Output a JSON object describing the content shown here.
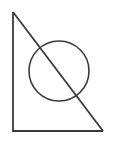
{
  "figure": {
    "background_color": "#ffffff",
    "stroke_color": "#3a3a3a",
    "canvas": {
      "width": 115,
      "height": 142
    },
    "shapes": {
      "triangle": {
        "name": "right-triangle",
        "apex_top_left": {
          "x": 13,
          "y": 12
        },
        "corner_bottom_left": {
          "x": 13,
          "y": 131
        },
        "corner_bottom_right": {
          "x": 103,
          "y": 131
        },
        "stroke_width": 1.8,
        "points": "13,12 13,131 103,131"
      },
      "circle": {
        "name": "circle",
        "center": {
          "x": 59,
          "y": 71
        },
        "radius": 30,
        "stroke_width": 1.6
      },
      "hypotenuse": {
        "name": "hypotenuse-diagonal",
        "from": {
          "x": 13,
          "y": 12
        },
        "to": {
          "x": 103,
          "y": 131
        },
        "stroke_width": 1.8
      }
    }
  }
}
